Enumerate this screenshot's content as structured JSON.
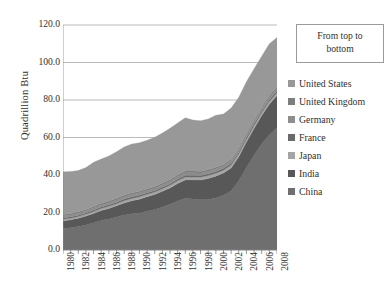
{
  "chart_data": {
    "type": "area",
    "stacked": true,
    "title": "",
    "xlabel": "",
    "ylabel": "Quadrillion Btu",
    "ylim": [
      0,
      120
    ],
    "ytick_labels": [
      "120.0",
      "100.0",
      "80.0",
      "60.0",
      "40.0",
      "20.0",
      "0.0"
    ],
    "ytick_values": [
      120,
      100,
      80,
      60,
      40,
      20,
      0
    ],
    "grid": "horizontal",
    "xlim": [
      1980,
      2008
    ],
    "x": [
      1980,
      1981,
      1982,
      1983,
      1984,
      1985,
      1986,
      1987,
      1988,
      1989,
      1990,
      1991,
      1992,
      1993,
      1994,
      1995,
      1996,
      1997,
      1998,
      1999,
      2000,
      2001,
      2002,
      2003,
      2004,
      2005,
      2006,
      2007,
      2008
    ],
    "xtick_labels": [
      "1980",
      "1982",
      "1984",
      "1986",
      "1988",
      "1990",
      "1992",
      "1994",
      "1996",
      "1998",
      "2000",
      "2002",
      "2004",
      "2006",
      "2008"
    ],
    "xtick_values": [
      1980,
      1982,
      1984,
      1986,
      1988,
      1990,
      1992,
      1994,
      1996,
      1998,
      2000,
      2002,
      2004,
      2006,
      2008
    ],
    "legend_position": "right",
    "legend_title": "From top to bottom",
    "stack_order_bottom_to_top": [
      "China",
      "India",
      "Japan",
      "France",
      "Germany",
      "United Kingdom",
      "United States"
    ],
    "series": [
      {
        "name": "China",
        "color": "#6f6f6f",
        "values": [
          11.5,
          11.9,
          12.6,
          13.4,
          14.5,
          15.7,
          16.5,
          17.6,
          18.7,
          19.4,
          19.8,
          20.7,
          21.6,
          23.0,
          24.4,
          26.2,
          27.6,
          27.2,
          26.8,
          27.0,
          27.8,
          29.2,
          31.5,
          37.0,
          44.0,
          50.5,
          56.5,
          61.5,
          65.2
        ]
      },
      {
        "name": "India",
        "color": "#585858",
        "values": [
          4.0,
          4.2,
          4.4,
          4.7,
          5.0,
          5.4,
          5.7,
          6.0,
          6.4,
          6.9,
          7.3,
          7.7,
          8.0,
          8.3,
          8.7,
          9.3,
          9.8,
          10.2,
          10.5,
          11.2,
          11.6,
          11.9,
          12.3,
          12.8,
          13.6,
          14.3,
          15.2,
          16.3,
          17.2
        ]
      },
      {
        "name": "Japan",
        "color": "#a5a5a5",
        "values": [
          0.9,
          0.9,
          0.9,
          1.0,
          1.0,
          1.0,
          1.1,
          1.1,
          1.2,
          1.2,
          1.3,
          1.3,
          1.3,
          1.4,
          1.4,
          1.4,
          1.5,
          1.5,
          1.5,
          1.5,
          1.5,
          1.5,
          1.5,
          1.5,
          1.5,
          1.5,
          1.5,
          1.5,
          1.5
        ]
      },
      {
        "name": "France",
        "color": "#6a6a6a",
        "values": [
          0.7,
          0.7,
          0.7,
          0.7,
          0.8,
          0.8,
          0.8,
          0.8,
          0.9,
          0.9,
          0.9,
          0.9,
          0.9,
          0.9,
          0.9,
          1.0,
          1.0,
          1.0,
          1.0,
          1.0,
          1.0,
          1.0,
          1.0,
          1.0,
          1.0,
          1.0,
          1.0,
          1.0,
          1.0
        ]
      },
      {
        "name": "Germany",
        "color": "#8d8d8d",
        "values": [
          1.0,
          1.0,
          1.0,
          1.0,
          1.1,
          1.1,
          1.1,
          1.2,
          1.2,
          1.2,
          1.2,
          1.2,
          1.2,
          1.2,
          1.3,
          1.3,
          1.3,
          1.3,
          1.3,
          1.3,
          1.3,
          1.3,
          1.3,
          1.3,
          1.3,
          1.3,
          1.3,
          1.3,
          1.3
        ]
      },
      {
        "name": "United Kingdom",
        "color": "#7d7d7d",
        "values": [
          0.8,
          0.8,
          0.8,
          0.8,
          0.8,
          0.9,
          0.9,
          0.9,
          0.9,
          0.9,
          0.9,
          0.9,
          0.9,
          0.9,
          0.9,
          0.9,
          0.9,
          0.9,
          0.9,
          0.9,
          0.9,
          0.9,
          0.9,
          0.9,
          0.9,
          0.9,
          0.9,
          0.9,
          0.9
        ]
      },
      {
        "name": "United States",
        "color": "#989898",
        "values": [
          22.8,
          22.4,
          22.0,
          22.4,
          23.6,
          23.6,
          24.0,
          24.8,
          25.7,
          26.0,
          25.8,
          25.8,
          26.2,
          26.7,
          27.3,
          27.7,
          28.4,
          27.2,
          26.9,
          27.0,
          27.8,
          26.8,
          27.2,
          27.0,
          27.5,
          27.2,
          27.0,
          27.5,
          26.3
        ]
      }
    ],
    "totals": [
      41.7,
      41.9,
      42.4,
      44.0,
      46.8,
      48.5,
      50.1,
      52.4,
      55.0,
      56.5,
      57.2,
      58.5,
      60.1,
      62.4,
      64.9,
      67.8,
      70.5,
      69.3,
      68.9,
      69.9,
      71.9,
      72.6,
      75.7,
      81.5,
      89.8,
      96.7,
      103.4,
      110.0,
      113.4
    ],
    "annotations": []
  },
  "legend": {
    "title_line1": "From top to",
    "title_line2": "bottom",
    "items": [
      {
        "label": "United States",
        "color": "#989898"
      },
      {
        "label": "United Kingdom",
        "color": "#7d7d7d"
      },
      {
        "label": "Germany",
        "color": "#8d8d8d"
      },
      {
        "label": "France",
        "color": "#6a6a6a"
      },
      {
        "label": "Japan",
        "color": "#a5a5a5"
      },
      {
        "label": "India",
        "color": "#585858"
      },
      {
        "label": "China",
        "color": "#6f6f6f"
      }
    ]
  },
  "axes": {
    "y_title": "Quadrillion Btu"
  }
}
